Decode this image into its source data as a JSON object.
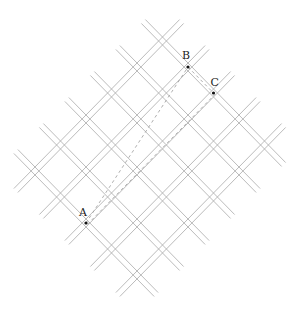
{
  "diagram": {
    "type": "street-grid-rotated-45",
    "colors": {
      "road": "#a9a9a9",
      "route": "#9a9a9a",
      "point": "#111111",
      "label": "#222222"
    },
    "grid": {
      "origin": [
        162.5,
        41
      ],
      "step_i": [
        25.5,
        26
      ],
      "step_j": [
        -25.5,
        26
      ],
      "i_range": [
        0,
        4
      ],
      "j_range": [
        0,
        5
      ],
      "road_gap": 2.8,
      "overhang": 0.75
    },
    "points": [
      {
        "label": "A",
        "i": 2,
        "j": 5,
        "label_offset": [
          -7,
          -7
        ]
      },
      {
        "label": "B",
        "i": 1,
        "j": 0,
        "label_offset": [
          -6,
          -8
        ]
      },
      {
        "label": "C",
        "i": 2,
        "j": 0,
        "label_offset": [
          -3,
          -7
        ]
      }
    ],
    "routes": [
      {
        "name": "straight-A-to-B",
        "from": "A",
        "to": "B",
        "offset": 0
      },
      {
        "name": "road-A-to-C",
        "from": "A",
        "to": "C",
        "offset": 2
      },
      {
        "name": "road-B-to-C",
        "from": "B",
        "to": "C",
        "offset": 0
      }
    ]
  }
}
